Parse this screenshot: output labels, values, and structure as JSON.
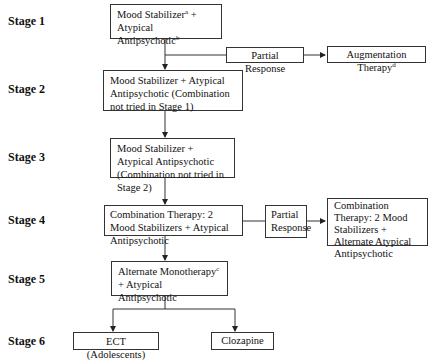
{
  "stages": [
    {
      "label": "Stage 1"
    },
    {
      "label": "Stage 2"
    },
    {
      "label": "Stage 3"
    },
    {
      "label": "Stage 4"
    },
    {
      "label": "Stage 5"
    },
    {
      "label": "Stage 6"
    }
  ],
  "boxes": {
    "s1": {
      "line1_a": "Mood Stabilizer",
      "sup_a": "a",
      "line1_b": " + Atypical",
      "line2": "Antipsychotic",
      "sup_b": "b"
    },
    "s1_partial": {
      "text": "Partial Response"
    },
    "s1_aug": {
      "text": "Augmentation Therapy",
      "sup": "d"
    },
    "s2": {
      "text": "Mood Stabilizer + Atypical Antipsychotic (Combination not tried in Stage 1)"
    },
    "s3": {
      "text": "Mood Stabilizer + Atypical Antipsychotic (Combination not tried in Stage 2)"
    },
    "s4": {
      "text": "Combination Therapy: 2 Mood Stabilizers + Atypical Antipsychotic"
    },
    "s4_partial": {
      "text": "Partial Response"
    },
    "s4_alt": {
      "text": "Combination Therapy: 2 Mood Stabilizers + Alternate Atypical Antipsychotic"
    },
    "s5": {
      "text_a": "Alternate Monotherapy",
      "sup": "c",
      "text_b": " + Atypical Antipsychotic"
    },
    "s6_ect": {
      "text": "ECT (Adolescents)"
    },
    "s6_cloz": {
      "text": "Clozapine"
    }
  },
  "colors": {
    "line": "#333333",
    "text": "#111111",
    "background": "#ffffff"
  }
}
